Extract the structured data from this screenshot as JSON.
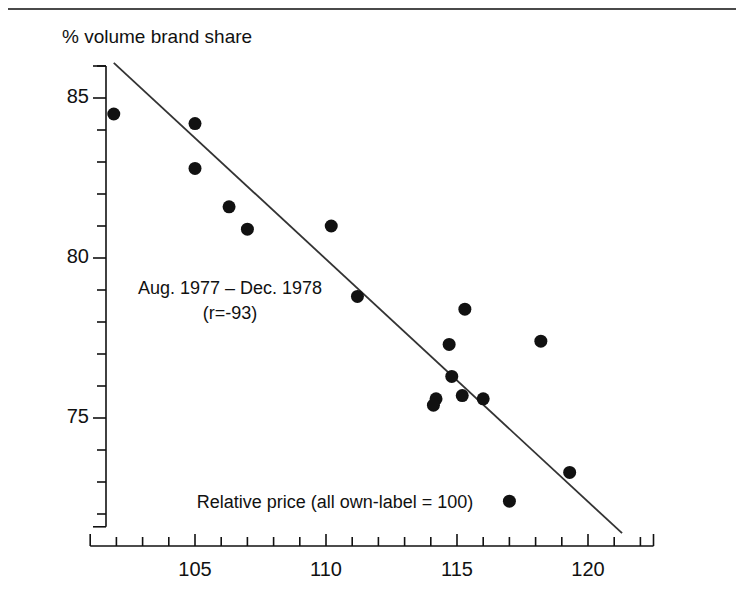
{
  "page": {
    "top_rule_ghost_text": "",
    "background_color": "#ffffff",
    "ink_color": "#111111"
  },
  "chart_data": {
    "type": "scatter",
    "title": "",
    "ylabel": "% volume brand share",
    "xlabel": "Relative price (all own-label = 100)",
    "xlim": [
      101.0,
      122.5
    ],
    "ylim": [
      71.6,
      86.0
    ],
    "grid": false,
    "legend_position": "none",
    "x_major_ticks": [
      105,
      110,
      115,
      120
    ],
    "x_major_tick_labels": [
      "105",
      "110",
      "115",
      "120"
    ],
    "x_minor_tick_step": 1,
    "y_major_ticks": [
      85,
      80,
      75
    ],
    "y_major_tick_labels": [
      "85",
      "80",
      "75"
    ],
    "y_minor_tick_step": 1,
    "annotations": [
      {
        "text": "Aug. 1977 – Dec. 1978",
        "x": 107.3,
        "y": 78.6
      },
      {
        "text": "(r=-93)",
        "x": 107.3,
        "y": 77.9
      },
      {
        "text": "Relative price (all own-label = 100)",
        "x": 110.5,
        "y": 72.6
      }
    ],
    "series": [
      {
        "name": "Brand share vs relative price",
        "marker": "filled-circle",
        "marker_color": "#111111",
        "marker_size": 13,
        "points": [
          {
            "x": 101.9,
            "y": 84.5
          },
          {
            "x": 105.0,
            "y": 84.2
          },
          {
            "x": 105.0,
            "y": 82.8
          },
          {
            "x": 106.3,
            "y": 81.6
          },
          {
            "x": 107.0,
            "y": 80.9
          },
          {
            "x": 110.2,
            "y": 81.0
          },
          {
            "x": 111.2,
            "y": 78.8
          },
          {
            "x": 115.3,
            "y": 78.4
          },
          {
            "x": 114.7,
            "y": 77.3
          },
          {
            "x": 118.2,
            "y": 77.4
          },
          {
            "x": 114.8,
            "y": 76.3
          },
          {
            "x": 115.2,
            "y": 75.7
          },
          {
            "x": 114.2,
            "y": 75.6
          },
          {
            "x": 114.1,
            "y": 75.4
          },
          {
            "x": 116.0,
            "y": 75.6
          },
          {
            "x": 119.3,
            "y": 73.3
          },
          {
            "x": 117.0,
            "y": 72.4
          }
        ]
      }
    ],
    "trendline": {
      "name": "regression-line",
      "color": "#333333",
      "x_start": 101.9,
      "y_start": 86.1,
      "x_end": 121.3,
      "y_end": 71.4
    },
    "correlation": "r=-93"
  }
}
